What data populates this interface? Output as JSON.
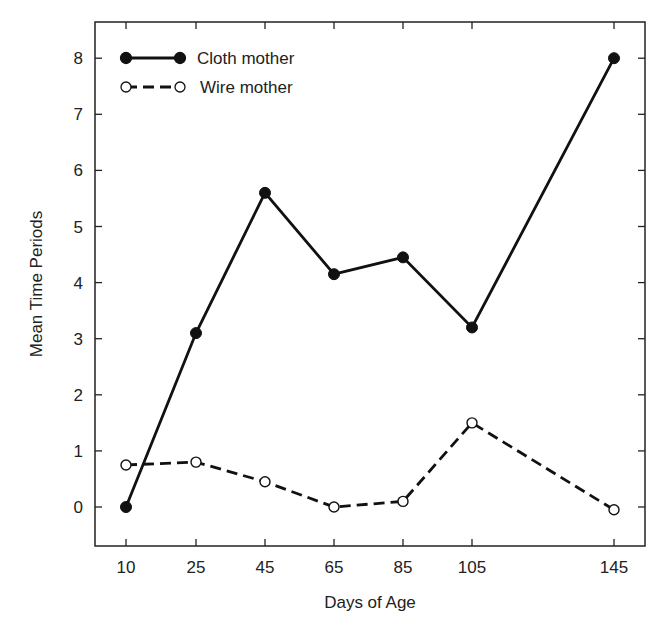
{
  "chart_data": {
    "type": "line",
    "title": "",
    "xlabel": "Days of Age",
    "ylabel": "Mean Time Periods",
    "x": [
      10,
      25,
      45,
      65,
      85,
      105,
      145
    ],
    "x_tick_labels": [
      "10",
      "25",
      "45",
      "65",
      "85",
      "105",
      "145"
    ],
    "y_ticks": [
      0,
      1,
      2,
      3,
      4,
      5,
      6,
      7,
      8
    ],
    "ylim": [
      -0.7,
      8.6
    ],
    "grid": false,
    "legend_position": "upper-left",
    "series": [
      {
        "name": "Cloth mother",
        "style": "solid",
        "marker": "filled-circle",
        "color": "#111111",
        "values": [
          0.0,
          3.1,
          5.6,
          4.15,
          4.45,
          3.2,
          8.0
        ]
      },
      {
        "name": "Wire mother",
        "style": "dashed",
        "marker": "open-circle",
        "color": "#111111",
        "values": [
          0.75,
          0.8,
          0.45,
          0.0,
          0.1,
          1.5,
          -0.05
        ]
      }
    ]
  },
  "layout": {
    "frame": {
      "left": 95,
      "top": 22,
      "right": 645,
      "bottom": 546
    },
    "x_pixels": [
      126,
      196,
      265,
      334,
      403,
      472,
      614
    ],
    "y_zero_px": 507,
    "y_px_per_unit": 56.1
  }
}
